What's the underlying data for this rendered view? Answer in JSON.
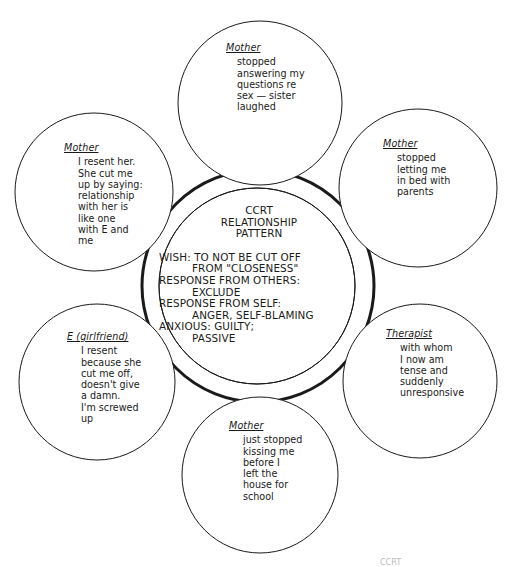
{
  "diagram": {
    "center": {
      "title": "CCRT\nRELATIONSHIP\nPATTERN",
      "lines": [
        {
          "text": "WISH: TO NOT BE CUT OFF",
          "indent": false
        },
        {
          "text": "FROM \"CLOSENESS\"",
          "indent": true
        },
        {
          "text": "RESPONSE FROM OTHERS:",
          "indent": false
        },
        {
          "text": "EXCLUDE",
          "indent": true
        },
        {
          "text": "RESPONSE FROM SELF:",
          "indent": false
        },
        {
          "text": "ANGER, SELF-BLAMING",
          "indent": true
        },
        {
          "text": "ANXIOUS: GUILTY;",
          "indent": false
        },
        {
          "text": "PASSIVE",
          "indent": true
        }
      ]
    },
    "episodes": [
      {
        "position": "top",
        "person": "Mother",
        "text": "stopped\nanswering my\nquestions re\nsex — sister\nlaughed"
      },
      {
        "position": "upper-right",
        "person": "Mother",
        "text": "stopped\nletting me\nin bed with\nparents"
      },
      {
        "position": "lower-right",
        "person": "Therapist",
        "text": "with whom\nI now am\ntense and\nsuddenly\nunresponsive"
      },
      {
        "position": "bottom",
        "person": "Mother",
        "text": "just stopped\nkissing me\nbefore I\nleft the\nhouse for\nschool"
      },
      {
        "position": "lower-left",
        "person": "E (girlfriend)",
        "text": "I resent\nbecause she\ncut me off,\ndoesn't give\na damn.\nI'm screwed\nup"
      },
      {
        "position": "upper-left",
        "person": "Mother",
        "text": "I resent her.\nShe cut me\nup by saying:\nrelationship\nwith her is\nlike one\nwith E and\nme"
      }
    ],
    "caption_fragment": "CCRT"
  }
}
